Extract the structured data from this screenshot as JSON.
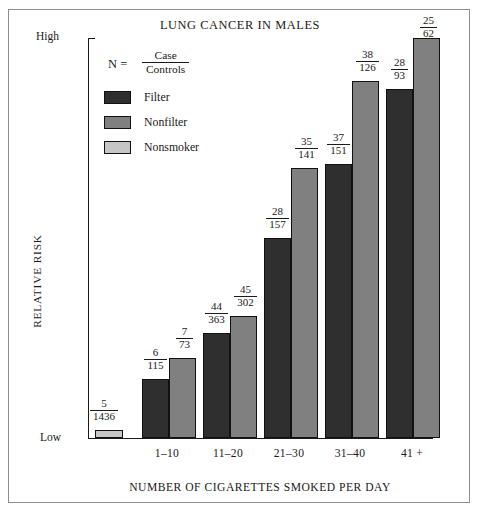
{
  "chart_data": {
    "type": "bar",
    "title": "LUNG CANCER IN MALES",
    "xlabel": "NUMBER OF CIGARETTES SMOKED PER DAY",
    "ylabel": "RELATIVE RISK",
    "y_axis_low_label": "Low",
    "y_axis_high_label": "High",
    "grid": false,
    "legend_position": "upper-left",
    "notation": {
      "symbol": "N =",
      "numerator": "Case",
      "denominator": "Controls"
    },
    "legend": [
      {
        "name": "Filter",
        "color": "#2f2f2f"
      },
      {
        "name": "Nonfilter",
        "color": "#808080"
      },
      {
        "name": "Nonsmoker",
        "color": "#c6c6c6"
      }
    ],
    "categories": [
      "1–10",
      "11–20",
      "21–30",
      "31–40",
      "41 +"
    ],
    "reference_bar": {
      "series": "Nonsmoker",
      "cases": 5,
      "controls": 1436,
      "label_numerator": "5",
      "label_denominator": "1436",
      "relative_height": 0.02
    },
    "series": [
      {
        "name": "Filter",
        "color": "#2f2f2f",
        "cases": [
          6,
          44,
          28,
          37,
          28
        ],
        "controls": [
          115,
          363,
          157,
          151,
          93
        ],
        "labels_numerator": [
          "6",
          "44",
          "28",
          "37",
          "28"
        ],
        "labels_denominator": [
          "115",
          "363",
          "157",
          "151",
          "93"
        ],
        "relative_heights": [
          0.147,
          0.261,
          0.498,
          0.682,
          0.869
        ]
      },
      {
        "name": "Nonfilter",
        "color": "#808080",
        "cases": [
          7,
          45,
          35,
          38,
          25
        ],
        "controls": [
          73,
          302,
          141,
          126,
          62
        ],
        "labels_numerator": [
          "7",
          "45",
          "35",
          "38",
          "25"
        ],
        "labels_denominator": [
          "73",
          "302",
          "141",
          "126",
          "62"
        ],
        "relative_heights": [
          0.199,
          0.304,
          0.672,
          0.889,
          0.997
        ]
      }
    ]
  },
  "bars": [
    {
      "name": "nonsmoker-reference",
      "series": "nonsmoker",
      "left": 95,
      "width": 28,
      "height": 8,
      "num": "5",
      "den": "1436",
      "label_left": 75,
      "label_top": 398
    },
    {
      "name": "filter-1-10",
      "series": "filter",
      "left": 142,
      "width": 27,
      "height": 59,
      "num": "6",
      "den": "115",
      "label_left": 127,
      "label_top": 347
    },
    {
      "name": "nonfilter-1-10",
      "series": "nonfilter",
      "left": 169,
      "width": 27,
      "height": 80,
      "num": "7",
      "den": "73",
      "label_left": 156,
      "label_top": 326
    },
    {
      "name": "filter-11-20",
      "series": "filter",
      "left": 203,
      "width": 27,
      "height": 105,
      "num": "44",
      "den": "363",
      "label_left": 188,
      "label_top": 301
    },
    {
      "name": "nonfilter-11-20",
      "series": "nonfilter",
      "left": 230,
      "width": 27,
      "height": 122,
      "num": "45",
      "den": "302",
      "label_left": 217,
      "label_top": 284
    },
    {
      "name": "filter-21-30",
      "series": "filter",
      "left": 264,
      "width": 27,
      "height": 200,
      "num": "28",
      "den": "157",
      "label_left": 249,
      "label_top": 206
    },
    {
      "name": "nonfilter-21-30",
      "series": "nonfilter",
      "left": 291,
      "width": 27,
      "height": 270,
      "num": "35",
      "den": "141",
      "label_left": 278,
      "label_top": 136
    },
    {
      "name": "filter-31-40",
      "series": "filter",
      "left": 325,
      "width": 27,
      "height": 274,
      "num": "37",
      "den": "151",
      "label_left": 310,
      "label_top": 132
    },
    {
      "name": "nonfilter-31-40",
      "series": "nonfilter",
      "left": 352,
      "width": 27,
      "height": 357,
      "num": "38",
      "den": "126",
      "label_left": 339,
      "label_top": 49
    },
    {
      "name": "filter-41plus",
      "series": "filter",
      "left": 386,
      "width": 27,
      "height": 349,
      "num": "28",
      "den": "93",
      "label_left": 371,
      "label_top": 57
    },
    {
      "name": "nonfilter-41plus",
      "series": "nonfilter",
      "left": 413,
      "width": 27,
      "height": 400,
      "num": "25",
      "den": "62",
      "label_left": 400,
      "label_top": 15
    }
  ],
  "group_labels": [
    {
      "text": "1–10",
      "left": 136,
      "width": 62
    },
    {
      "text": "11–20",
      "left": 197,
      "width": 62
    },
    {
      "text": "21–30",
      "left": 258,
      "width": 62
    },
    {
      "text": "31–40",
      "left": 319,
      "width": 62
    },
    {
      "text": "41 +",
      "left": 381,
      "width": 62
    }
  ]
}
